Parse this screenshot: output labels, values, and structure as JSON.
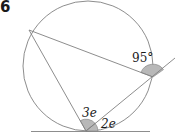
{
  "question_number": "6",
  "diagram": {
    "labels": {
      "angle_exterior": "95°",
      "angle_a": "3e",
      "angle_b": "2e"
    },
    "colors": {
      "line": "#7a7a7a",
      "shade": "#b5b5b5",
      "text": "#1a1a1a"
    }
  }
}
